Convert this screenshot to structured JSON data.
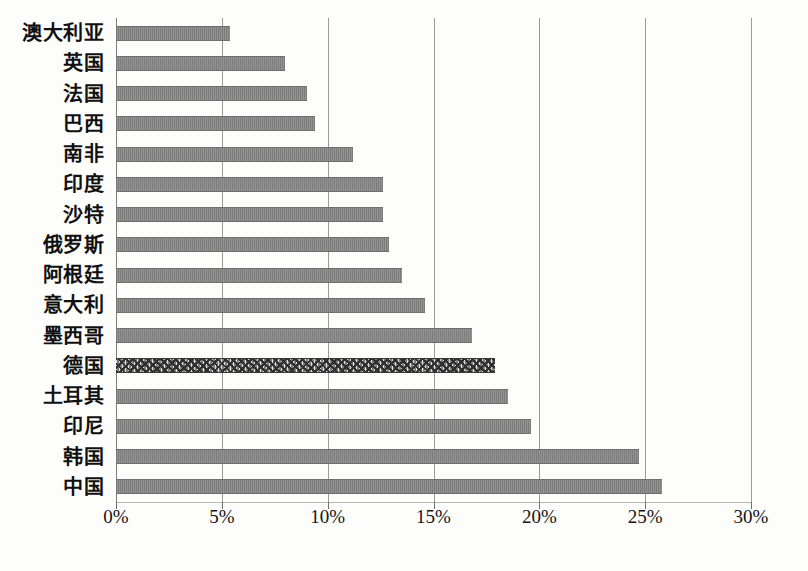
{
  "chart_data": {
    "type": "bar",
    "orientation": "horizontal",
    "title": "",
    "subtitle": "",
    "xlabel": "",
    "ylabel": "",
    "xlim": [
      0,
      30
    ],
    "xunit": "%",
    "grid": true,
    "legend": null,
    "categories": [
      "澳大利亚",
      "英国",
      "法国",
      "巴西",
      "南非",
      "印度",
      "沙特",
      "俄罗斯",
      "阿根廷",
      "意大利",
      "墨西哥",
      "德国",
      "土耳其",
      "印尼",
      "韩国",
      "中国"
    ],
    "values": [
      5.4,
      8.0,
      9.0,
      9.4,
      11.2,
      12.6,
      12.6,
      12.9,
      13.5,
      14.6,
      16.8,
      17.9,
      18.5,
      19.6,
      24.7,
      25.8
    ],
    "highlighted_category": "德国",
    "highlighted_index": 11,
    "tick_values": [
      0,
      5,
      10,
      15,
      20,
      25,
      30
    ],
    "tick_labels": [
      "0%",
      "5%",
      "10%",
      "15%",
      "20%",
      "25%",
      "30%"
    ],
    "bar_color": "#858585",
    "highlight_color": "#3a3a3a",
    "gridline_color": "#9a9a9a",
    "background_color": "#fdfdfc"
  }
}
